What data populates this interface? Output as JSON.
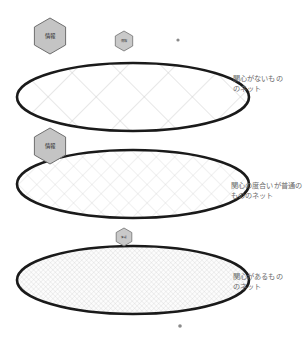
{
  "canvas": {
    "width": 308,
    "height": 342,
    "background": "#ffffff"
  },
  "colors": {
    "ellipse_stroke": "#1a1a1a",
    "mesh_line": "#c9c9c9",
    "mesh_line_fine": "#d8d8d8",
    "hexagon_fill": "#c4c4c4",
    "hexagon_stroke": "#6e6e6e",
    "label_text": "#6b6b6b",
    "hexagon_text": "#2a2a2a",
    "dot": "#8a8a8a"
  },
  "nets": [
    {
      "id": "net-coarse",
      "label": "関心がないもの\nのネット",
      "mesh": "coarse",
      "mesh_spacing": 34,
      "center_x": 133,
      "center_y": 97,
      "radius_x": 116,
      "radius_y": 34
    },
    {
      "id": "net-medium",
      "label": "関心の度合いが普通の\nもののネット",
      "mesh": "medium",
      "mesh_spacing": 13,
      "center_x": 133,
      "center_y": 184,
      "radius_x": 116,
      "radius_y": 34
    },
    {
      "id": "net-fine",
      "label": "関心があるもの\nのネット",
      "mesh": "fine",
      "mesh_spacing": 3.4,
      "center_x": 133,
      "center_y": 280,
      "radius_x": 116,
      "radius_y": 34
    }
  ],
  "hexagons": [
    {
      "id": "hex-large-top",
      "text": "情報",
      "size": "large",
      "cx": 50,
      "cy": 36,
      "r": 18
    },
    {
      "id": "hex-small-top",
      "text": "情報",
      "size": "small",
      "cx": 124,
      "cy": 41,
      "r": 10
    },
    {
      "id": "hex-large-middle",
      "text": "情報",
      "size": "large",
      "cx": 50,
      "cy": 146,
      "r": 18
    },
    {
      "id": "hex-small-bottom",
      "text": "情報",
      "size": "small",
      "cx": 124,
      "cy": 237,
      "r": 9
    }
  ],
  "dots": [
    {
      "id": "dot-top-right",
      "cx": 178,
      "cy": 40,
      "r": 1.6
    },
    {
      "id": "dot-bottom",
      "cx": 180,
      "cy": 326,
      "r": 1.8
    }
  ]
}
